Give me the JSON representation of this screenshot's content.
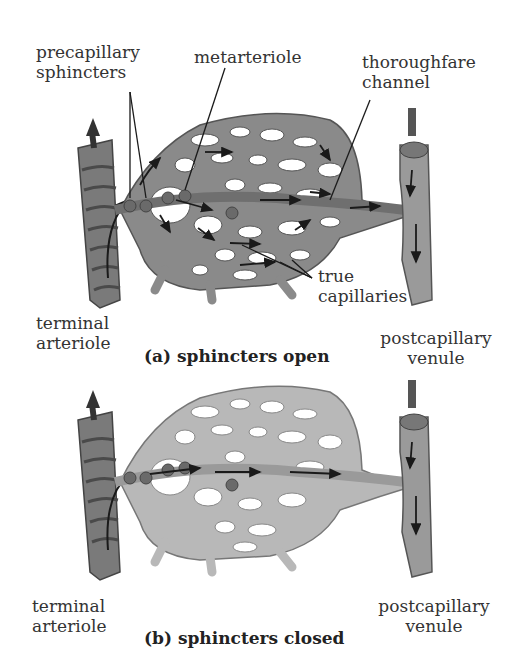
{
  "panel_a": {
    "caption": "(a) sphincters open",
    "labels": {
      "precapillary_1": "precapillary",
      "precapillary_2": "sphincters",
      "metarteriole": "metarteriole",
      "thoroughfare_1": "thoroughfare",
      "thoroughfare_2": "channel",
      "true_1": "true",
      "true_2": "capillaries",
      "terminal_1": "terminal",
      "terminal_2": "arteriole",
      "postcap_1": "postcapillary",
      "postcap_2": "venule"
    }
  },
  "panel_b": {
    "caption": "(b) sphincters closed",
    "labels": {
      "terminal_1": "terminal",
      "terminal_2": "arteriole",
      "postcap_1": "postcapillary",
      "postcap_2": "venule"
    }
  },
  "colors": {
    "vessel_open": "#8a8a8a",
    "vessel_closed": "#b4b4b4",
    "outline": "#555555",
    "arrow": "#1a1a1a"
  }
}
